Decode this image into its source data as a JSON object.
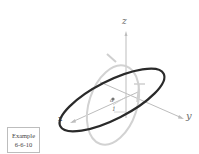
{
  "diagram": {
    "axes": {
      "x_label": "x",
      "y_label": "y",
      "z_label": "z"
    },
    "marks": {
      "center_label": "a",
      "unit_label": "1"
    },
    "example": {
      "line1": "Example",
      "line2": "6-6-10"
    },
    "colors": {
      "ellipse": "#2a2a2a",
      "circle": "#cfcfcf",
      "axes": "#bdbdbd",
      "text": "#6b6b6b"
    }
  }
}
